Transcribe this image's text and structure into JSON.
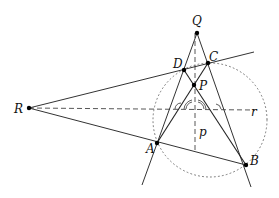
{
  "diagram": {
    "points": {
      "Q": {
        "label": "Q",
        "x": 197,
        "y": 33
      },
      "C": {
        "label": "C",
        "x": 208,
        "y": 63
      },
      "D": {
        "label": "D",
        "x": 184,
        "y": 70
      },
      "P": {
        "label": "P",
        "x": 193,
        "y": 85
      },
      "R": {
        "label": "R",
        "x": 29,
        "y": 108
      },
      "A": {
        "label": "A",
        "x": 157,
        "y": 143
      },
      "B": {
        "label": "B",
        "x": 246,
        "y": 165
      }
    },
    "line_labels": {
      "p": "p",
      "r": "r"
    },
    "circle": {
      "cx": 210,
      "cy": 120,
      "r": 57,
      "style": "dotted"
    },
    "colors": {
      "stroke": "#333333",
      "point": "#000000",
      "dashed": "#444444",
      "circle": "#777777"
    }
  }
}
